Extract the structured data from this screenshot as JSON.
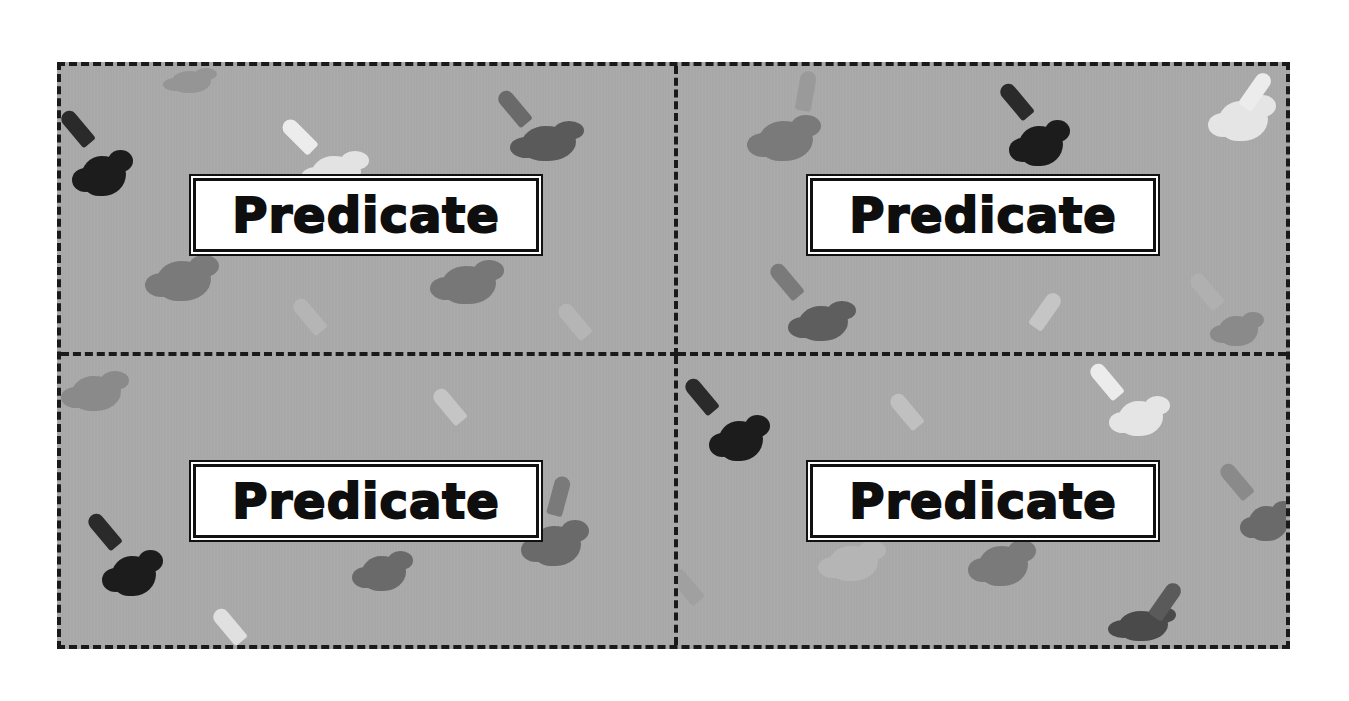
{
  "sheet": {
    "layout": "2x2 cut-out cards with dashed cut lines",
    "background_color": "#a8a8a8",
    "cut_line_color": "#1a1a1a"
  },
  "cards": [
    {
      "label": "Predicate"
    },
    {
      "label": "Predicate"
    },
    {
      "label": "Predicate"
    },
    {
      "label": "Predicate"
    }
  ],
  "decorations": {
    "icon": "paint-marker-splat-icon",
    "colors": [
      "#1f1f1f",
      "#5e5e5e",
      "#7d7d7d",
      "#e6e6e6",
      "#b9b9b9"
    ]
  }
}
